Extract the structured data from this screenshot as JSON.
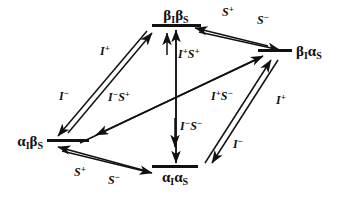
{
  "figure": {
    "background_color": "#ffffff",
    "ink_color": "#111111",
    "width": 340,
    "height": 200
  },
  "nodes": [
    {
      "id": "beta-I-beta-S",
      "name": "top-state",
      "greek_first": "β",
      "sub_first": "I",
      "greek_second": "β",
      "sub_second": "S",
      "label": "βIβS",
      "position": "top"
    },
    {
      "id": "beta-I-alpha-S",
      "name": "right-state",
      "greek_first": "β",
      "sub_first": "I",
      "greek_second": "α",
      "sub_second": "S",
      "label": "βIαS",
      "position": "right"
    },
    {
      "id": "alpha-I-beta-S",
      "name": "left-state",
      "greek_first": "α",
      "sub_first": "I",
      "greek_second": "β",
      "sub_second": "S",
      "label": "αIβS",
      "position": "left"
    },
    {
      "id": "alpha-I-alpha-S",
      "name": "bottom-state",
      "greek_first": "α",
      "sub_first": "I",
      "greek_second": "α",
      "sub_second": "S",
      "label": "αIαS",
      "position": "bottom"
    }
  ],
  "edges": [
    {
      "id": "left-to-top",
      "name": "edge-alphaIbetaS-to-betaIbetaS",
      "from": "alpha-I-beta-S",
      "to": "beta-I-beta-S",
      "forward_label_base": "I",
      "forward_label_sup": "+",
      "forward_label": "I⁺",
      "reverse_label_base": "I",
      "reverse_label_sup": "−",
      "reverse_label": "I⁻"
    },
    {
      "id": "top-to-right",
      "name": "edge-betaIbetaS-to-betaIalphaS",
      "from": "beta-I-beta-S",
      "to": "beta-I-alpha-S",
      "forward_label_base": "S",
      "forward_label_sup": "−",
      "forward_label": "S⁻",
      "reverse_label_base": "S",
      "reverse_label_sup": "+",
      "reverse_label": "S⁺"
    },
    {
      "id": "bottom-to-right",
      "name": "edge-alphaIalphaS-to-betaIalphaS",
      "from": "alpha-I-alpha-S",
      "to": "beta-I-alpha-S",
      "forward_label_base": "I",
      "forward_label_sup": "+",
      "forward_label": "I⁺",
      "reverse_label_base": "I",
      "reverse_label_sup": "−",
      "reverse_label": "I⁻"
    },
    {
      "id": "left-to-bottom",
      "name": "edge-alphaIbetaS-to-alphaIalphaS",
      "from": "alpha-I-beta-S",
      "to": "alpha-I-alpha-S",
      "forward_label_base": "S",
      "forward_label_sup": "−",
      "forward_label": "S⁻",
      "reverse_label_base": "S",
      "reverse_label_sup": "+",
      "reverse_label": "S⁺"
    },
    {
      "id": "vertical-upper",
      "name": "edge-vertical-upper",
      "from": "alpha-I-alpha-S",
      "to": "beta-I-beta-S",
      "forward_label_base": "I",
      "forward_label_sup": "+",
      "forward_label_base2": "S",
      "forward_label_sup2": "+",
      "forward_label": "I⁺S⁺"
    },
    {
      "id": "vertical-lower",
      "name": "edge-vertical-lower",
      "from": "beta-I-beta-S",
      "to": "alpha-I-alpha-S",
      "forward_label_base": "I",
      "forward_label_sup": "−",
      "forward_label_base2": "S",
      "forward_label_sup2": "−",
      "forward_label": "I⁻S⁻"
    },
    {
      "id": "diagonal-left",
      "name": "edge-diagonal-betaIalphaS-to-alphaIbetaS",
      "from": "beta-I-alpha-S",
      "to": "alpha-I-beta-S",
      "forward_label_base": "I",
      "forward_label_sup": "−",
      "forward_label_base2": "S",
      "forward_label_sup2": "+",
      "forward_label": "I⁻S⁺"
    },
    {
      "id": "diagonal-right",
      "name": "edge-diagonal-alphaIbetaS-to-betaIalphaS",
      "from": "alpha-I-beta-S",
      "to": "beta-I-alpha-S",
      "forward_label_base": "I",
      "forward_label_sup": "+",
      "forward_label_base2": "S",
      "forward_label_sup2": "−",
      "forward_label": "I⁺S⁻"
    }
  ],
  "labels": {
    "top_node": "βIβS",
    "right_node": "βIαS",
    "left_node": "αIβS",
    "bottom_node": "αIαS",
    "l1_base": "I",
    "l1_sup": "+",
    "l2_base": "I",
    "l2_sup": "−",
    "l3_base": "S",
    "l3_sup": "+",
    "l4_base": "S",
    "l4_sup": "−",
    "l5_base": "S",
    "l5_sup": "+",
    "l6_base": "S",
    "l6_sup": "−",
    "l7_base": "I",
    "l7_sup": "+",
    "l8_base": "I",
    "l8_sup": "−",
    "v1_b1": "I",
    "v1_s1": "+",
    "v1_b2": "S",
    "v1_s2": "+",
    "v2_b1": "I",
    "v2_s1": "−",
    "v2_b2": "S",
    "v2_s2": "−",
    "d1_b1": "I",
    "d1_s1": "−",
    "d1_b2": "S",
    "d1_s2": "+",
    "d2_b1": "I",
    "d2_s1": "+",
    "d2_b2": "S",
    "d2_s2": "−",
    "greek_alpha": "α",
    "greek_beta": "β",
    "sub_I": "I",
    "sub_S": "S"
  }
}
